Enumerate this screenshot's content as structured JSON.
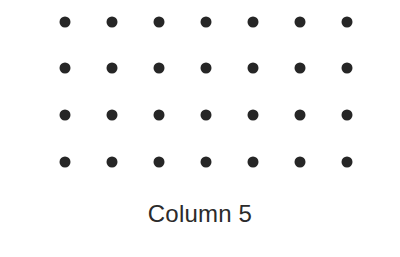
{
  "figure": {
    "background_color": "#ffffff",
    "label": "Column 5",
    "label_color": "#2b2b2b",
    "label_font_size": 24
  },
  "chart_data": {
    "type": "scatter",
    "title": "",
    "subtitle": "",
    "xlabel": "Column 5",
    "ylabel": "",
    "legend": [],
    "grid": false,
    "marker": {
      "shape": "circle",
      "color": "#262626",
      "diameter_px": 11
    },
    "layout": {
      "rows": 4,
      "columns": 7,
      "total_points": 28,
      "column_spacing_px": 47,
      "row_spacing_px": 46.5,
      "first_point_x_px": 65,
      "first_point_y_px": 22
    },
    "xlim": [
      0,
      400
    ],
    "ylim": [
      257,
      0
    ],
    "x": [
      65,
      112,
      159,
      206,
      253,
      300,
      347,
      65,
      112,
      159,
      206,
      253,
      300,
      347,
      65,
      112,
      159,
      206,
      253,
      300,
      347,
      65,
      112,
      159,
      206,
      253,
      300,
      347
    ],
    "y": [
      22,
      22,
      22,
      22,
      22,
      22,
      22,
      68,
      68,
      68,
      68,
      68,
      68,
      68,
      115,
      115,
      115,
      115,
      115,
      115,
      115,
      162,
      162,
      162,
      162,
      162,
      162,
      162
    ],
    "points": [
      {
        "x": 65,
        "y": 22
      },
      {
        "x": 112,
        "y": 22
      },
      {
        "x": 159,
        "y": 22
      },
      {
        "x": 206,
        "y": 22
      },
      {
        "x": 253,
        "y": 22
      },
      {
        "x": 300,
        "y": 22
      },
      {
        "x": 347,
        "y": 22
      },
      {
        "x": 65,
        "y": 68
      },
      {
        "x": 112,
        "y": 68
      },
      {
        "x": 159,
        "y": 68
      },
      {
        "x": 206,
        "y": 68
      },
      {
        "x": 253,
        "y": 68
      },
      {
        "x": 300,
        "y": 68
      },
      {
        "x": 347,
        "y": 68
      },
      {
        "x": 65,
        "y": 115
      },
      {
        "x": 112,
        "y": 115
      },
      {
        "x": 159,
        "y": 115
      },
      {
        "x": 206,
        "y": 115
      },
      {
        "x": 253,
        "y": 115
      },
      {
        "x": 300,
        "y": 115
      },
      {
        "x": 347,
        "y": 115
      },
      {
        "x": 65,
        "y": 162
      },
      {
        "x": 112,
        "y": 162
      },
      {
        "x": 159,
        "y": 162
      },
      {
        "x": 206,
        "y": 162
      },
      {
        "x": 253,
        "y": 162
      },
      {
        "x": 300,
        "y": 162
      },
      {
        "x": 347,
        "y": 162
      }
    ]
  }
}
